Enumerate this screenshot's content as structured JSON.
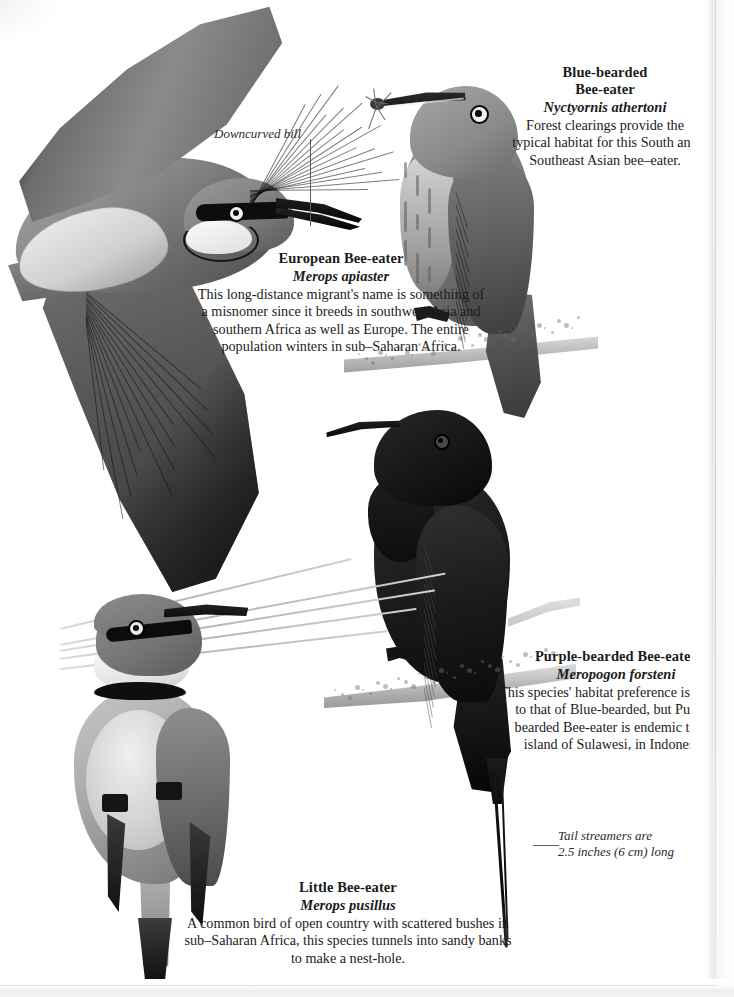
{
  "page": {
    "type": "field-guide-plate",
    "background_color": "#ffffff",
    "text_color": "#1b1b1b"
  },
  "captions": {
    "european": {
      "common_name": "European Bee-eater",
      "scientific_name": "Merops apiaster",
      "description": "This long-distance migrant's name is something of a misnomer since it breeds in southwest Asia and southern Africa as well as Europe. The entire population winters in sub–Saharan Africa."
    },
    "blue_bearded": {
      "common_name": "Blue-bearded\nBee-eater",
      "common_name_line1": "Blue-bearded",
      "common_name_line2": "Bee-eater",
      "scientific_name": "Nyctyornis athertoni",
      "description": "Forest clearings provide the typical habitat for this South and Southeast Asian bee–eater."
    },
    "purple_bearded": {
      "common_name": "Purple-bearded Bee-eater",
      "scientific_name": "Meropogon forsteni",
      "description": "This species' habitat preference is similar to that of Blue-bearded, but Purple-bearded Bee-eater is endemic to the island of Sulawesi, in Indonesia."
    },
    "little": {
      "common_name": "Little Bee-eater",
      "scientific_name": "Merops pusillus",
      "description": "A common bird of open country with scattered bushes in sub–Saharan Africa, this species tunnels into sandy banks to make a nest-hole."
    }
  },
  "annotations": {
    "downcurved_bill": "Downcurved bill",
    "tail_streamers_line1": "Tail streamers are",
    "tail_streamers_line2": "2.5 inches (6 cm) long"
  },
  "illustrations": [
    {
      "id": "european-bee-eater",
      "pose": "in flight, wings spread",
      "position": "upper left"
    },
    {
      "id": "blue-bearded-bee-eater",
      "pose": "perched on branch with insect in bill",
      "position": "upper right"
    },
    {
      "id": "purple-bearded-bee-eater",
      "pose": "perched on branch, long tail streamers",
      "position": "center"
    },
    {
      "id": "little-bee-eater",
      "pose": "perched on grass stem, facing viewer",
      "position": "lower left"
    }
  ]
}
